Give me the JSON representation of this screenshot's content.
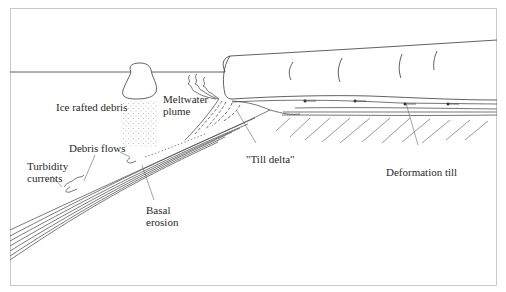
{
  "figure": {
    "type": "glacier-margin cross-section diagram",
    "line_color": "#3a3a3a",
    "background": "#ffffff",
    "labels": {
      "ice_rafted_debris": "Ice rafted debris",
      "meltwater_plume_line1": "Meltwater",
      "meltwater_plume_line2": "plume",
      "debris_flows": "Debris flows",
      "turbidity_line1": "Turbidity",
      "turbidity_line2": "currents",
      "till_delta": "\"Till delta\"",
      "deformation_till": "Deformation till",
      "basal_line1": "Basal",
      "basal_line2": "erosion"
    },
    "features": [
      "sea-level-line",
      "iceberg",
      "ice-rafted-debris-stipple",
      "meltwater-plume",
      "glacier-ice-shelf",
      "till-delta-foresets",
      "subglacial-deformation-till",
      "bedrock-hatching",
      "slope-strata",
      "debris-flows",
      "turbidity-currents",
      "basal-erosion"
    ]
  }
}
